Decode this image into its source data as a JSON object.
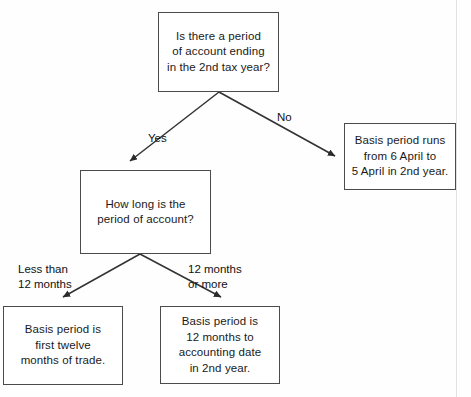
{
  "diagram": {
    "type": "flowchart",
    "nodes": [
      {
        "id": "q1",
        "role": "decision",
        "text": "Is there a period\nof account ending\nin the 2nd tax year?"
      },
      {
        "id": "q2",
        "role": "decision",
        "text": "How long is the\nperiod of account?"
      },
      {
        "id": "r1",
        "role": "outcome",
        "text": "Basis period runs\nfrom 6 April to\n5 April in 2nd year."
      },
      {
        "id": "r2",
        "role": "outcome",
        "text": "Basis period is\nfirst twelve\nmonths of trade."
      },
      {
        "id": "r3",
        "role": "outcome",
        "text": "Basis period is\n12 months to\naccounting date\nin 2nd year."
      }
    ],
    "edges": [
      {
        "id": "yes",
        "from": "q1",
        "to": "q2",
        "label": "Yes"
      },
      {
        "id": "no",
        "from": "q1",
        "to": "r1",
        "label": "No"
      },
      {
        "id": "less",
        "from": "q2",
        "to": "r2",
        "label": "Less than\n12 months"
      },
      {
        "id": "twelve",
        "from": "q2",
        "to": "r3",
        "label": "12 months\nor more"
      }
    ],
    "colors": {
      "box_border": "#4b4b4b",
      "box_fill": "#ffffff",
      "connector": "#333333",
      "text": "#1a1a1a",
      "page_edge": "#e2e2e2"
    }
  }
}
